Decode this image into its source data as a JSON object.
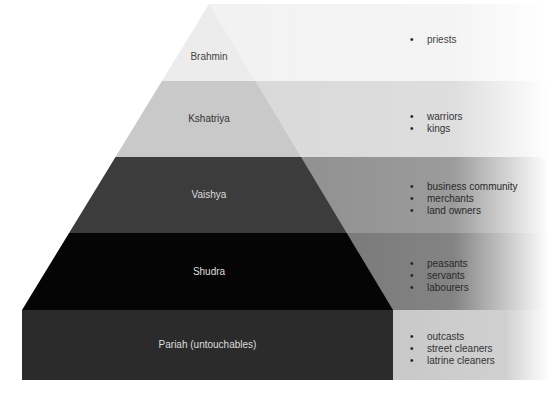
{
  "tiers": [
    {
      "name": "Brahmin",
      "items": [
        "priests"
      ],
      "fill": "#ececec",
      "band_color": "#f2f2f2",
      "text_color": "#444444",
      "item_text_color": "#444444"
    },
    {
      "name": "Kshatriya",
      "items": [
        "warriors",
        "kings"
      ],
      "fill": "#c9c9c9",
      "band_color": "#d8d8d8",
      "text_color": "#333333",
      "item_text_color": "#333333"
    },
    {
      "name": "Vaishya",
      "items": [
        "business community",
        "merchants",
        "land owners"
      ],
      "fill": "#3c3c3c",
      "band_color": "#8a8a8a",
      "text_color": "#dddddd",
      "item_text_color": "#2a2a2a"
    },
    {
      "name": "Shudra",
      "items": [
        "peasants",
        "servants",
        "labourers"
      ],
      "fill": "#050505",
      "band_color": "#6e6e6e",
      "text_color": "#dddddd",
      "item_text_color": "#2a2a2a"
    },
    {
      "name": "Pariah (untouchables)",
      "items": [
        "outcasts",
        "street cleaners",
        "latrine cleaners"
      ],
      "fill": "#2b2b2b",
      "band_color": "#c8c8c8",
      "text_color": "#dddddd",
      "item_text_color": "#333333"
    }
  ]
}
